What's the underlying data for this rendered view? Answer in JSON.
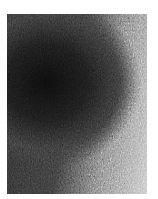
{
  "image": {
    "description": "Grayscale noisy texture photo with dark region upper-left fading to light gray on right",
    "colors": {
      "dark": "#0c0c0c",
      "mid": "#3a3a3a",
      "light": "#c8c8c8",
      "background": "#ffffff"
    }
  }
}
